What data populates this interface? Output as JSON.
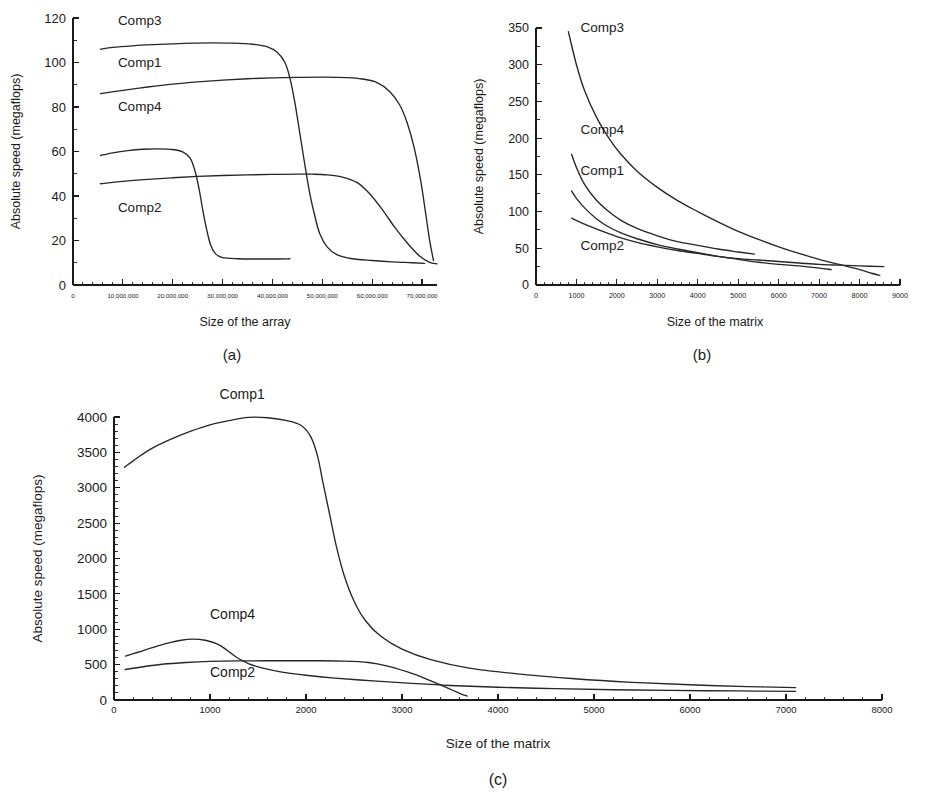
{
  "figure": {
    "background": "#ffffff",
    "ink_color": "#262626",
    "panels": [
      "a",
      "b",
      "c"
    ]
  },
  "chart_data": [
    {
      "id": "a",
      "type": "line",
      "title": "",
      "caption": "(a)",
      "xlabel": "Size of the array",
      "ylabel": "Absolute speed (megaflops)",
      "xlim": [
        0,
        73000000
      ],
      "ylim": [
        0,
        120
      ],
      "grid": false,
      "legend_position": "inline-labels",
      "x_ticks": [
        0,
        10000000,
        20000000,
        30000000,
        40000000,
        50000000,
        60000000,
        70000000
      ],
      "x_tick_labels": [
        "0",
        "10,000,000",
        "20,000,000",
        "30,000,000",
        "40,000,000",
        "50,000,000",
        "60,000,000",
        "70,000,000"
      ],
      "y_ticks": [
        0,
        20,
        40,
        60,
        80,
        100,
        120
      ],
      "y_tick_labels": [
        "0",
        "20",
        "40",
        "60",
        "80",
        "100",
        "120"
      ],
      "x_minor_per_major": 5,
      "y_minor_per_major": 2,
      "series": [
        {
          "name": "Comp3",
          "label_x": 9000000,
          "label_y": 117,
          "points": [
            [
              5500000,
              106
            ],
            [
              8000000,
              106.8
            ],
            [
              12000000,
              107.5
            ],
            [
              16000000,
              108
            ],
            [
              20000000,
              108.4
            ],
            [
              24000000,
              108.7
            ],
            [
              28000000,
              108.8
            ],
            [
              32000000,
              108.7
            ],
            [
              36000000,
              108.2
            ],
            [
              39000000,
              107
            ],
            [
              41000000,
              104.5
            ],
            [
              42500000,
              100
            ],
            [
              43500000,
              93
            ],
            [
              44500000,
              82
            ],
            [
              45500000,
              68
            ],
            [
              46500000,
              54
            ],
            [
              47500000,
              41
            ],
            [
              48500000,
              31
            ],
            [
              49500000,
              23
            ],
            [
              51000000,
              17
            ],
            [
              53000000,
              13.5
            ],
            [
              56000000,
              11.8
            ],
            [
              60000000,
              11
            ],
            [
              64000000,
              10.4
            ],
            [
              68000000,
              10
            ],
            [
              70500000,
              9.7
            ]
          ]
        },
        {
          "name": "Comp1",
          "label_x": 9000000,
          "label_y": 98,
          "points": [
            [
              5500000,
              86
            ],
            [
              10000000,
              87.5
            ],
            [
              15000000,
              89
            ],
            [
              20000000,
              90.3
            ],
            [
              25000000,
              91.3
            ],
            [
              30000000,
              92.1
            ],
            [
              35000000,
              92.7
            ],
            [
              40000000,
              93.1
            ],
            [
              45000000,
              93.3
            ],
            [
              50000000,
              93.4
            ],
            [
              55000000,
              93.2
            ],
            [
              58000000,
              92.6
            ],
            [
              61000000,
              91
            ],
            [
              63500000,
              87
            ],
            [
              65500000,
              81
            ],
            [
              67000000,
              73
            ],
            [
              68500000,
              61
            ],
            [
              69800000,
              46
            ],
            [
              70800000,
              31
            ],
            [
              71600000,
              19
            ],
            [
              72300000,
              11
            ]
          ]
        },
        {
          "name": "Comp4",
          "label_x": 9000000,
          "label_y": 78,
          "points": [
            [
              5500000,
              58.2
            ],
            [
              8000000,
              59.4
            ],
            [
              11000000,
              60.4
            ],
            [
              14000000,
              61
            ],
            [
              17000000,
              61.2
            ],
            [
              20000000,
              60.9
            ],
            [
              22000000,
              59.8
            ],
            [
              23500000,
              57
            ],
            [
              24500000,
              51
            ],
            [
              25300000,
              43
            ],
            [
              26000000,
              34
            ],
            [
              26800000,
              25
            ],
            [
              27600000,
              18
            ],
            [
              28600000,
              14
            ],
            [
              30000000,
              12.3
            ],
            [
              33000000,
              11.8
            ],
            [
              37000000,
              11.7
            ],
            [
              41000000,
              11.7
            ],
            [
              43500000,
              11.8
            ]
          ]
        },
        {
          "name": "Comp2",
          "label_x": 9000000,
          "label_y": 33,
          "points": [
            [
              5500000,
              45.5
            ],
            [
              10000000,
              46.6
            ],
            [
              15000000,
              47.5
            ],
            [
              20000000,
              48.2
            ],
            [
              25000000,
              48.8
            ],
            [
              30000000,
              49.2
            ],
            [
              35000000,
              49.5
            ],
            [
              40000000,
              49.7
            ],
            [
              45000000,
              49.8
            ],
            [
              48000000,
              49.8
            ],
            [
              51000000,
              49.5
            ],
            [
              54000000,
              48.5
            ],
            [
              57000000,
              46
            ],
            [
              59500000,
              41
            ],
            [
              62000000,
              34
            ],
            [
              64500000,
              26
            ],
            [
              67000000,
              19
            ],
            [
              69500000,
              13
            ],
            [
              71500000,
              10.2
            ],
            [
              73000000,
              9.5
            ]
          ]
        }
      ]
    },
    {
      "id": "b",
      "type": "line",
      "title": "",
      "caption": "(b)",
      "xlabel": "Size of the matrix",
      "ylabel": "Absolute speed (megaflops)",
      "xlim": [
        0,
        9000
      ],
      "ylim": [
        0,
        350
      ],
      "grid": false,
      "legend_position": "inline-labels",
      "x_ticks": [
        0,
        1000,
        2000,
        3000,
        4000,
        5000,
        6000,
        7000,
        8000,
        9000
      ],
      "x_tick_labels": [
        "0",
        "1000",
        "2000",
        "3000",
        "4000",
        "5000",
        "6000",
        "7000",
        "8000",
        "9000"
      ],
      "y_ticks": [
        0,
        50,
        100,
        150,
        200,
        250,
        300,
        350
      ],
      "y_tick_labels": [
        "0",
        "50",
        "100",
        "150",
        "200",
        "250",
        "300",
        "350"
      ],
      "x_minor_per_major": 5,
      "y_minor_per_major": 2,
      "series": [
        {
          "name": "Comp3",
          "label_x": 1100,
          "label_y": 345,
          "points": [
            [
              800,
              345
            ],
            [
              1000,
              300
            ],
            [
              1200,
              265
            ],
            [
              1500,
              228
            ],
            [
              1800,
              200
            ],
            [
              2100,
              178
            ],
            [
              2500,
              155
            ],
            [
              3000,
              133
            ],
            [
              3500,
              115
            ],
            [
              4000,
              100
            ],
            [
              4500,
              86
            ],
            [
              5000,
              73
            ],
            [
              5500,
              62
            ],
            [
              6000,
              52
            ],
            [
              6500,
              43
            ],
            [
              7000,
              35
            ],
            [
              7500,
              28
            ],
            [
              8000,
              21
            ],
            [
              8300,
              16
            ],
            [
              8500,
              13
            ]
          ]
        },
        {
          "name": "Comp4",
          "label_x": 1100,
          "label_y": 205,
          "points": [
            [
              880,
              178
            ],
            [
              1000,
              160
            ],
            [
              1200,
              137
            ],
            [
              1500,
              115
            ],
            [
              1800,
              100
            ],
            [
              2100,
              88
            ],
            [
              2500,
              77
            ],
            [
              3000,
              67
            ],
            [
              3500,
              59
            ],
            [
              4000,
              54
            ],
            [
              4500,
              49
            ],
            [
              5000,
              45
            ],
            [
              5400,
              42
            ]
          ]
        },
        {
          "name": "Comp1",
          "label_x": 1100,
          "label_y": 150,
          "points": [
            [
              880,
              128
            ],
            [
              1000,
              118
            ],
            [
              1200,
              105
            ],
            [
              1500,
              90
            ],
            [
              1800,
              79
            ],
            [
              2100,
              71
            ],
            [
              2500,
              63
            ],
            [
              3000,
              55
            ],
            [
              3500,
              49
            ],
            [
              4000,
              44
            ],
            [
              4500,
              39
            ],
            [
              5000,
              35
            ],
            [
              5500,
              31
            ],
            [
              6000,
              28
            ],
            [
              6500,
              26
            ],
            [
              7000,
              23
            ],
            [
              7300,
              21
            ]
          ]
        },
        {
          "name": "Comp2",
          "label_x": 1100,
          "label_y": 48,
          "points": [
            [
              880,
              91
            ],
            [
              1200,
              83
            ],
            [
              1600,
              74
            ],
            [
              2000,
              66
            ],
            [
              2500,
              58
            ],
            [
              3000,
              52
            ],
            [
              3500,
              47
            ],
            [
              4000,
              43
            ],
            [
              4500,
              39
            ],
            [
              5000,
              36
            ],
            [
              5500,
              34
            ],
            [
              6000,
              32
            ],
            [
              6500,
              30
            ],
            [
              7000,
              28
            ],
            [
              7500,
              27
            ],
            [
              8000,
              26
            ],
            [
              8600,
              25
            ]
          ]
        }
      ]
    },
    {
      "id": "c",
      "type": "line",
      "title": "",
      "caption": "(c)",
      "xlabel": "Size of the matrix",
      "ylabel": "Absolute speed (megaflops)",
      "xlim": [
        0,
        8000
      ],
      "ylim": [
        0,
        4000
      ],
      "grid": false,
      "legend_position": "inline-labels",
      "x_ticks": [
        0,
        1000,
        2000,
        3000,
        4000,
        5000,
        6000,
        7000,
        8000
      ],
      "x_tick_labels": [
        "0",
        "1000",
        "2000",
        "3000",
        "4000",
        "5000",
        "6000",
        "7000",
        "8000"
      ],
      "y_ticks": [
        0,
        500,
        1000,
        1500,
        2000,
        2500,
        3000,
        3500,
        4000
      ],
      "y_tick_labels": [
        "0",
        "500",
        "1000",
        "1500",
        "2000",
        "2500",
        "3000",
        "3500",
        "4000"
      ],
      "x_minor_per_major": 5,
      "y_minor_per_major": 5,
      "series": [
        {
          "name": "Comp1",
          "label_x": 1100,
          "label_y": 4250,
          "points": [
            [
              110,
              3290
            ],
            [
              250,
              3430
            ],
            [
              400,
              3560
            ],
            [
              600,
              3690
            ],
            [
              800,
              3800
            ],
            [
              1000,
              3890
            ],
            [
              1200,
              3950
            ],
            [
              1400,
              3995
            ],
            [
              1600,
              3990
            ],
            [
              1800,
              3950
            ],
            [
              1950,
              3880
            ],
            [
              2050,
              3720
            ],
            [
              2120,
              3450
            ],
            [
              2180,
              3050
            ],
            [
              2250,
              2600
            ],
            [
              2320,
              2150
            ],
            [
              2400,
              1750
            ],
            [
              2500,
              1400
            ],
            [
              2620,
              1120
            ],
            [
              2780,
              900
            ],
            [
              3000,
              720
            ],
            [
              3300,
              570
            ],
            [
              3700,
              450
            ],
            [
              4200,
              370
            ],
            [
              4800,
              300
            ],
            [
              5400,
              250
            ],
            [
              6000,
              215
            ],
            [
              6600,
              190
            ],
            [
              7100,
              175
            ]
          ]
        },
        {
          "name": "Comp4",
          "label_x": 1000,
          "label_y": 1150,
          "points": [
            [
              120,
              620
            ],
            [
              250,
              675
            ],
            [
              400,
              740
            ],
            [
              550,
              800
            ],
            [
              700,
              845
            ],
            [
              820,
              860
            ],
            [
              950,
              845
            ],
            [
              1080,
              790
            ],
            [
              1180,
              700
            ],
            [
              1280,
              600
            ],
            [
              1400,
              515
            ],
            [
              1550,
              450
            ],
            [
              1750,
              395
            ],
            [
              2000,
              350
            ],
            [
              2300,
              310
            ],
            [
              2700,
              270
            ],
            [
              3100,
              235
            ],
            [
              3500,
              205
            ],
            [
              4000,
              180
            ],
            [
              4600,
              160
            ],
            [
              5200,
              145
            ],
            [
              5800,
              135
            ],
            [
              6500,
              128
            ],
            [
              7100,
              122
            ]
          ]
        },
        {
          "name": "Comp2",
          "label_x": 1000,
          "label_y": 330,
          "points": [
            [
              115,
              430
            ],
            [
              300,
              470
            ],
            [
              500,
              505
            ],
            [
              750,
              530
            ],
            [
              1000,
              545
            ],
            [
              1300,
              552
            ],
            [
              1700,
              555
            ],
            [
              2100,
              555
            ],
            [
              2400,
              550
            ],
            [
              2650,
              530
            ],
            [
              2850,
              480
            ],
            [
              3050,
              400
            ],
            [
              3250,
              300
            ],
            [
              3450,
              185
            ],
            [
              3600,
              95
            ],
            [
              3680,
              55
            ]
          ]
        }
      ]
    }
  ]
}
